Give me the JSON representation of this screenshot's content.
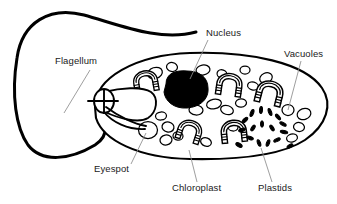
{
  "figure": {
    "background_color": "#ffffff",
    "line_color": "#000000",
    "leader_color": "#8c8c8c",
    "label_color": "#1a1a1a"
  },
  "labels": [
    {
      "id": "flagellum",
      "text": "Flagellum",
      "x": 55,
      "y": 64,
      "anchor": "start",
      "leader": {
        "x1": 90,
        "y1": 70,
        "x2": 64,
        "y2": 113
      }
    },
    {
      "id": "nucleus",
      "text": "Nucleus",
      "x": 206,
      "y": 36,
      "anchor": "start",
      "leader": {
        "x1": 208,
        "y1": 40,
        "x2": 190,
        "y2": 79
      }
    },
    {
      "id": "vacuoles",
      "text": "Vacuoles",
      "x": 284,
      "y": 57,
      "anchor": "start",
      "leader": {
        "x1": 301,
        "y1": 61,
        "x2": 288,
        "y2": 110
      }
    },
    {
      "id": "eyespot",
      "text": "Eyespot",
      "x": 94,
      "y": 172,
      "anchor": "start",
      "leader": {
        "x1": 131,
        "y1": 164,
        "x2": 146,
        "y2": 133
      }
    },
    {
      "id": "chloroplast",
      "text": "Chloroplast",
      "x": 172,
      "y": 191,
      "anchor": "start",
      "leader": {
        "x1": 197,
        "y1": 182,
        "x2": 189,
        "y2": 150
      }
    },
    {
      "id": "plastids",
      "text": "Plastids",
      "x": 258,
      "y": 191,
      "anchor": "start",
      "leader": {
        "x1": 272,
        "y1": 182,
        "x2": 261,
        "y2": 148
      }
    }
  ],
  "structures": {
    "cell_body": {
      "name": "cell-body",
      "path": "M 95 107 C 95 78 135 55 190 53 C 250 51 305 63 322 88 C 333 104 327 125 305 140 C 282 155 240 160 190 159 C 138 158 103 140 96 118 Z"
    },
    "flagellum": {
      "name": "flagellum-strand",
      "path": "M 196 32 C 160 42 120 25 84 15 C 50 6 22 22 17 58 C 11 95 16 128 28 145 C 42 163 70 160 95 145 C 112 134 104 119 97 113"
    },
    "reservoir": {
      "name": "reservoir-gullet",
      "ring_cx": 104,
      "ring_cy": 101,
      "ring_rx": 10,
      "ring_ry": 12
    },
    "nucleus": {
      "name": "nucleus-body",
      "cx": 185,
      "cy": 90,
      "rx": 22,
      "ry": 18
    }
  },
  "organelle_counts": {
    "vacuoles": 24,
    "chloroplasts": 6,
    "plastids": 17,
    "nucleus": 1,
    "eyespot": 1,
    "flagellum": 1
  },
  "vacuoles": [
    {
      "cx": 155,
      "cy": 73,
      "rx": 7.5,
      "ry": 5.5,
      "rot": -18
    },
    {
      "cx": 172,
      "cy": 67,
      "rx": 5.5,
      "ry": 4.5,
      "rot": 10
    },
    {
      "cx": 203,
      "cy": 70,
      "rx": 7.0,
      "ry": 5.0,
      "rot": -10
    },
    {
      "cx": 222,
      "cy": 74,
      "rx": 5.0,
      "ry": 4.2,
      "rot": 20
    },
    {
      "cx": 245,
      "cy": 70,
      "rx": 5.0,
      "ry": 4.0,
      "rot": 0
    },
    {
      "cx": 266,
      "cy": 78,
      "rx": 6.5,
      "ry": 5.0,
      "rot": -25
    },
    {
      "cx": 253,
      "cy": 86,
      "rx": 5.5,
      "ry": 4.0,
      "rot": 15
    },
    {
      "cx": 145,
      "cy": 99,
      "rx": 6.0,
      "ry": 5.0,
      "rot": -8
    },
    {
      "cx": 196,
      "cy": 110,
      "rx": 7.0,
      "ry": 5.0,
      "rot": 5
    },
    {
      "cx": 214,
      "cy": 104,
      "rx": 7.5,
      "ry": 4.8,
      "rot": -12
    },
    {
      "cx": 227,
      "cy": 110,
      "rx": 6.5,
      "ry": 4.5,
      "rot": 18
    },
    {
      "cx": 241,
      "cy": 103,
      "rx": 5.5,
      "ry": 4.2,
      "rot": -5
    },
    {
      "cx": 288,
      "cy": 110,
      "rx": 6.0,
      "ry": 5.5,
      "rot": 0
    },
    {
      "cx": 304,
      "cy": 114,
      "rx": 7.0,
      "ry": 5.5,
      "rot": -20
    },
    {
      "cx": 299,
      "cy": 127,
      "rx": 5.5,
      "ry": 4.5,
      "rot": 10
    },
    {
      "cx": 292,
      "cy": 138,
      "rx": 5.5,
      "ry": 4.0,
      "rot": -15
    },
    {
      "cx": 148,
      "cy": 130,
      "rx": 9.5,
      "ry": 8.5,
      "rot": 0
    },
    {
      "cx": 168,
      "cy": 127,
      "rx": 6.0,
      "ry": 5.0,
      "rot": 12
    },
    {
      "cx": 166,
      "cy": 140,
      "rx": 6.0,
      "ry": 5.0,
      "rot": -10
    },
    {
      "cx": 178,
      "cy": 136,
      "rx": 5.0,
      "ry": 4.2,
      "rot": 5
    },
    {
      "cx": 206,
      "cy": 142,
      "rx": 5.5,
      "ry": 4.2,
      "rot": 20
    },
    {
      "cx": 161,
      "cy": 116,
      "rx": 5.5,
      "ry": 4.0,
      "rot": -5
    },
    {
      "cx": 180,
      "cy": 87,
      "rx": 4.5,
      "ry": 3.8,
      "rot": 0
    },
    {
      "cx": 233,
      "cy": 127,
      "rx": 5.0,
      "ry": 4.0,
      "rot": 8
    }
  ],
  "chloroplasts": [
    {
      "id": "c1",
      "cx": 145,
      "cy": 84,
      "scale": 1.0,
      "rot": -10
    },
    {
      "id": "c2",
      "cx": 228,
      "cy": 87,
      "scale": 1.05,
      "rot": 8
    },
    {
      "id": "c3",
      "cx": 268,
      "cy": 95,
      "scale": 1.1,
      "rot": 14
    },
    {
      "id": "c4",
      "cx": 188,
      "cy": 133,
      "scale": 1.0,
      "rot": 18
    },
    {
      "id": "c5",
      "cx": 233,
      "cy": 134,
      "scale": 1.05,
      "rot": -6
    },
    {
      "id": "c6",
      "cx": 206,
      "cy": 124,
      "scale": 0.0,
      "rot": 0
    }
  ],
  "plastids": [
    {
      "cx": 252,
      "cy": 113,
      "w": 3.2,
      "h": 7.5,
      "rot": 20
    },
    {
      "cx": 261,
      "cy": 110,
      "w": 3.0,
      "h": 7.0,
      "rot": 5
    },
    {
      "cx": 270,
      "cy": 112,
      "w": 3.0,
      "h": 7.5,
      "rot": -20
    },
    {
      "cx": 278,
      "cy": 117,
      "w": 3.0,
      "h": 7.0,
      "rot": -40
    },
    {
      "cx": 245,
      "cy": 120,
      "w": 3.2,
      "h": 7.0,
      "rot": 45
    },
    {
      "cx": 283,
      "cy": 124,
      "w": 3.0,
      "h": 7.0,
      "rot": -62
    },
    {
      "cx": 242,
      "cy": 130,
      "w": 3.0,
      "h": 7.0,
      "rot": 70
    },
    {
      "cx": 284,
      "cy": 132,
      "w": 3.2,
      "h": 7.5,
      "rot": -78
    },
    {
      "cx": 250,
      "cy": 138,
      "w": 3.0,
      "h": 7.0,
      "rot": 110
    },
    {
      "cx": 277,
      "cy": 140,
      "w": 3.0,
      "h": 7.0,
      "rot": -115
    },
    {
      "cx": 259,
      "cy": 143,
      "w": 3.0,
      "h": 7.0,
      "rot": 160
    },
    {
      "cx": 268,
      "cy": 143,
      "w": 3.0,
      "h": 7.0,
      "rot": -160
    },
    {
      "cx": 262,
      "cy": 124,
      "w": 3.0,
      "h": 6.5,
      "rot": 0
    },
    {
      "cx": 253,
      "cy": 128,
      "w": 3.0,
      "h": 6.5,
      "rot": 35
    },
    {
      "cx": 272,
      "cy": 128,
      "w": 3.0,
      "h": 6.5,
      "rot": -35
    },
    {
      "cx": 239,
      "cy": 145,
      "w": 3.5,
      "h": 7.0,
      "rot": 120
    },
    {
      "cx": 290,
      "cy": 146,
      "w": 3.0,
      "h": 6.5,
      "rot": -120
    }
  ]
}
